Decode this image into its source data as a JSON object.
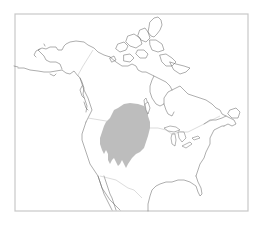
{
  "map": {
    "region": "North America",
    "projection": "Lambert conformal (approx.)",
    "frame": {
      "x": 15,
      "y": 14,
      "width": 233,
      "height": 197
    },
    "colors": {
      "background": "#ffffff",
      "frame_stroke": "#c8c8c8",
      "coastline": "#6a6a6a",
      "political_border": "#c4c4c4",
      "range_fill": "#bdbdbd"
    },
    "layers": [
      {
        "name": "coastlines",
        "visible": true
      },
      {
        "name": "country-borders",
        "visible": true
      },
      {
        "name": "species-range",
        "visible": true,
        "fill": "#bdbdbd",
        "description": "Shaded distribution area across the Great Plains / Prairie region"
      }
    ]
  }
}
